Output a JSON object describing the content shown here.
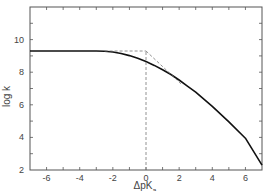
{
  "chart_data": {
    "type": "line",
    "title": "",
    "xlabel": "ΔpK",
    "xlabel_subscript": "a",
    "ylabel": "log k",
    "xlim": [
      -7,
      7
    ],
    "ylim": [
      2,
      12
    ],
    "grid": false,
    "legend": null,
    "x_ticks": [
      -6,
      -4,
      -2,
      0,
      2,
      4,
      6
    ],
    "x_tick_labels": [
      "-6",
      "-4",
      "-2",
      "0",
      "2",
      "4",
      "6"
    ],
    "x_minor_ticks": [
      -7,
      -5,
      -3,
      -1,
      1,
      3,
      5,
      7
    ],
    "y_ticks": [
      2,
      4,
      6,
      8,
      10
    ],
    "y_tick_labels": [
      "2",
      "4",
      "6",
      "8",
      "10"
    ],
    "y_minor_ticks": [
      3,
      5,
      7,
      9,
      11
    ],
    "series": [
      {
        "name": "log k (observed curve)",
        "style": "solid",
        "color": "#111111",
        "x": [
          -7,
          -5,
          -3,
          -2.5,
          -2,
          -1.5,
          -1,
          -0.5,
          0,
          0.5,
          1,
          1.5,
          2,
          2.5,
          3,
          4,
          5,
          6,
          7
        ],
        "y": [
          9.3,
          9.3,
          9.3,
          9.28,
          9.24,
          9.15,
          9.02,
          8.85,
          8.65,
          8.42,
          8.15,
          7.86,
          7.52,
          7.15,
          6.78,
          5.9,
          4.95,
          3.95,
          2.3
        ]
      },
      {
        "name": "limiting asymptote (plateau)",
        "style": "dashed",
        "color": "#777777",
        "x": [
          -2.5,
          0
        ],
        "y": [
          9.3,
          9.3
        ]
      },
      {
        "name": "limiting asymptote (slope -1)",
        "style": "dashed",
        "color": "#777777",
        "x": [
          0,
          2.2
        ],
        "y": [
          9.3,
          7.2
        ]
      },
      {
        "name": "vertical marker at ΔpKa = 0",
        "style": "dashed",
        "color": "#777777",
        "x": [
          0,
          0
        ],
        "y": [
          2,
          9.3
        ]
      }
    ]
  }
}
